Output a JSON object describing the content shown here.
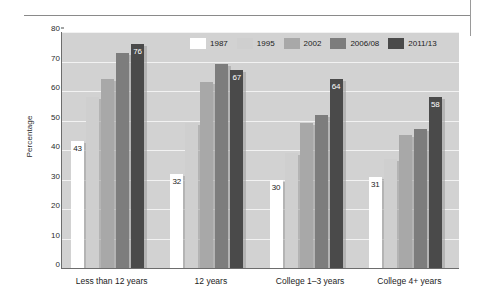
{
  "chart_data": {
    "type": "bar",
    "title": "",
    "xlabel": "",
    "ylabel": "Percentage",
    "ylim": [
      0,
      80
    ],
    "ytick_step": 10,
    "yticks": [
      0,
      10,
      20,
      30,
      40,
      50,
      60,
      70,
      80
    ],
    "grid": true,
    "legend_position": "top-center",
    "categories": [
      "Less than 12 years",
      "12 years",
      "College 1–3 years",
      "College 4+ years"
    ],
    "series": [
      {
        "name": "1987",
        "color": "#ffffff",
        "values": [
          43,
          32,
          30,
          31
        ],
        "labels": [
          "43",
          "32",
          "30",
          "31"
        ],
        "label_style": "dark"
      },
      {
        "name": "1995",
        "color": "#cfcfcf",
        "values": [
          58,
          49,
          39,
          37
        ],
        "labels": [
          "",
          "",
          "",
          ""
        ],
        "label_style": "none"
      },
      {
        "name": "2002",
        "color": "#a8a8a8",
        "values": [
          64,
          63,
          49,
          45
        ],
        "labels": [
          "",
          "",
          "",
          ""
        ],
        "label_style": "none"
      },
      {
        "name": "2006/08",
        "color": "#7d7d7d",
        "values": [
          73,
          69,
          52,
          47
        ],
        "labels": [
          "",
          "",
          "",
          ""
        ],
        "label_style": "none"
      },
      {
        "name": "2011/13",
        "color": "#4a4a4a",
        "values": [
          76,
          67,
          64,
          58
        ],
        "labels": [
          "76",
          "67",
          "64",
          "58"
        ],
        "label_style": "inside"
      }
    ],
    "plot_background": "#d2d2d2",
    "gridline_color": "#f2f2f2",
    "axis_color": "#6d6d6d"
  }
}
